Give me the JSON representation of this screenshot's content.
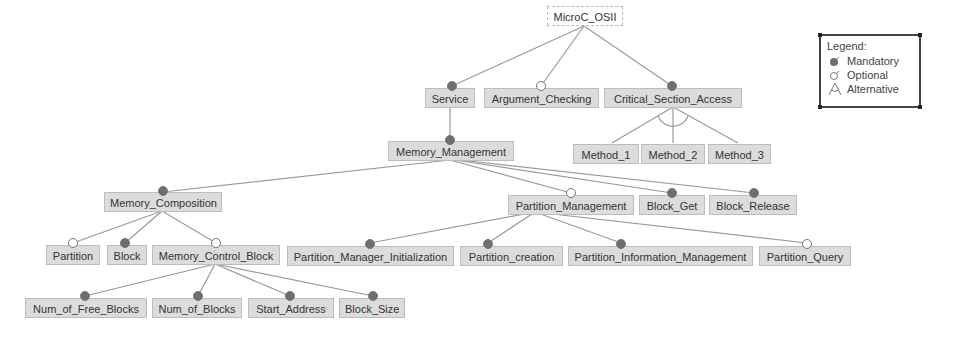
{
  "diagram": {
    "type": "feature-model",
    "colors": {
      "node_fill": "#dcdcdc",
      "node_border": "#bdbdbd",
      "edge": "#9a9a9a",
      "mandatory_marker": "#6e6e6e",
      "optional_marker": "#ffffff"
    },
    "nodes": {
      "root": "MicroC_OSII",
      "service": "Service",
      "argument_checking": "Argument_Checking",
      "critical_section_access": "Critical_Section_Access",
      "method_1": "Method_1",
      "method_2": "Method_2",
      "method_3": "Method_3",
      "memory_management": "Memory_Management",
      "memory_composition": "Memory_Composition",
      "partition_management": "Partition_Management",
      "block_get": "Block_Get",
      "block_release": "Block_Release",
      "partition": "Partition",
      "block": "Block",
      "memory_control_block": "Memory_Control_Block",
      "partition_manager_initialization": "Partition_Manager_Initialization",
      "partition_creation": "Partition_creation",
      "partition_information_management": "Partition_Information_Management",
      "partition_query": "Partition_Query",
      "num_of_free_blocks": "Num_of_Free_Blocks",
      "num_of_blocks": "Num_of_Blocks",
      "start_address": "Start_Address",
      "block_size": "Block_Size"
    },
    "relations": [
      {
        "parent": "MicroC_OSII",
        "child": "Service",
        "kind": "mandatory"
      },
      {
        "parent": "MicroC_OSII",
        "child": "Argument_Checking",
        "kind": "optional"
      },
      {
        "parent": "MicroC_OSII",
        "child": "Critical_Section_Access",
        "kind": "mandatory"
      },
      {
        "parent": "Critical_Section_Access",
        "children": [
          "Method_1",
          "Method_2",
          "Method_3"
        ],
        "kind": "alternative"
      },
      {
        "parent": "Service",
        "child": "Memory_Management",
        "kind": "mandatory"
      },
      {
        "parent": "Memory_Management",
        "child": "Memory_Composition",
        "kind": "mandatory"
      },
      {
        "parent": "Memory_Management",
        "child": "Partition_Management",
        "kind": "optional"
      },
      {
        "parent": "Memory_Management",
        "child": "Block_Get",
        "kind": "mandatory"
      },
      {
        "parent": "Memory_Management",
        "child": "Block_Release",
        "kind": "mandatory"
      },
      {
        "parent": "Memory_Composition",
        "child": "Partition",
        "kind": "optional"
      },
      {
        "parent": "Memory_Composition",
        "child": "Block",
        "kind": "mandatory"
      },
      {
        "parent": "Memory_Composition",
        "child": "Memory_Control_Block",
        "kind": "optional"
      },
      {
        "parent": "Partition_Management",
        "child": "Partition_Manager_Initialization",
        "kind": "mandatory"
      },
      {
        "parent": "Partition_Management",
        "child": "Partition_creation",
        "kind": "mandatory"
      },
      {
        "parent": "Partition_Management",
        "child": "Partition_Information_Management",
        "kind": "mandatory"
      },
      {
        "parent": "Partition_Management",
        "child": "Partition_Query",
        "kind": "optional"
      },
      {
        "parent": "Memory_Control_Block",
        "child": "Num_of_Free_Blocks",
        "kind": "mandatory"
      },
      {
        "parent": "Memory_Control_Block",
        "child": "Num_of_Blocks",
        "kind": "mandatory"
      },
      {
        "parent": "Memory_Control_Block",
        "child": "Start_Address",
        "kind": "mandatory"
      },
      {
        "parent": "Memory_Control_Block",
        "child": "Block_Size",
        "kind": "mandatory"
      }
    ]
  },
  "legend": {
    "title": "Legend:",
    "items": [
      {
        "symbol": "mandatory",
        "label": "Mandatory"
      },
      {
        "symbol": "optional",
        "label": "Optional"
      },
      {
        "symbol": "alternative",
        "label": "Alternative"
      }
    ]
  }
}
